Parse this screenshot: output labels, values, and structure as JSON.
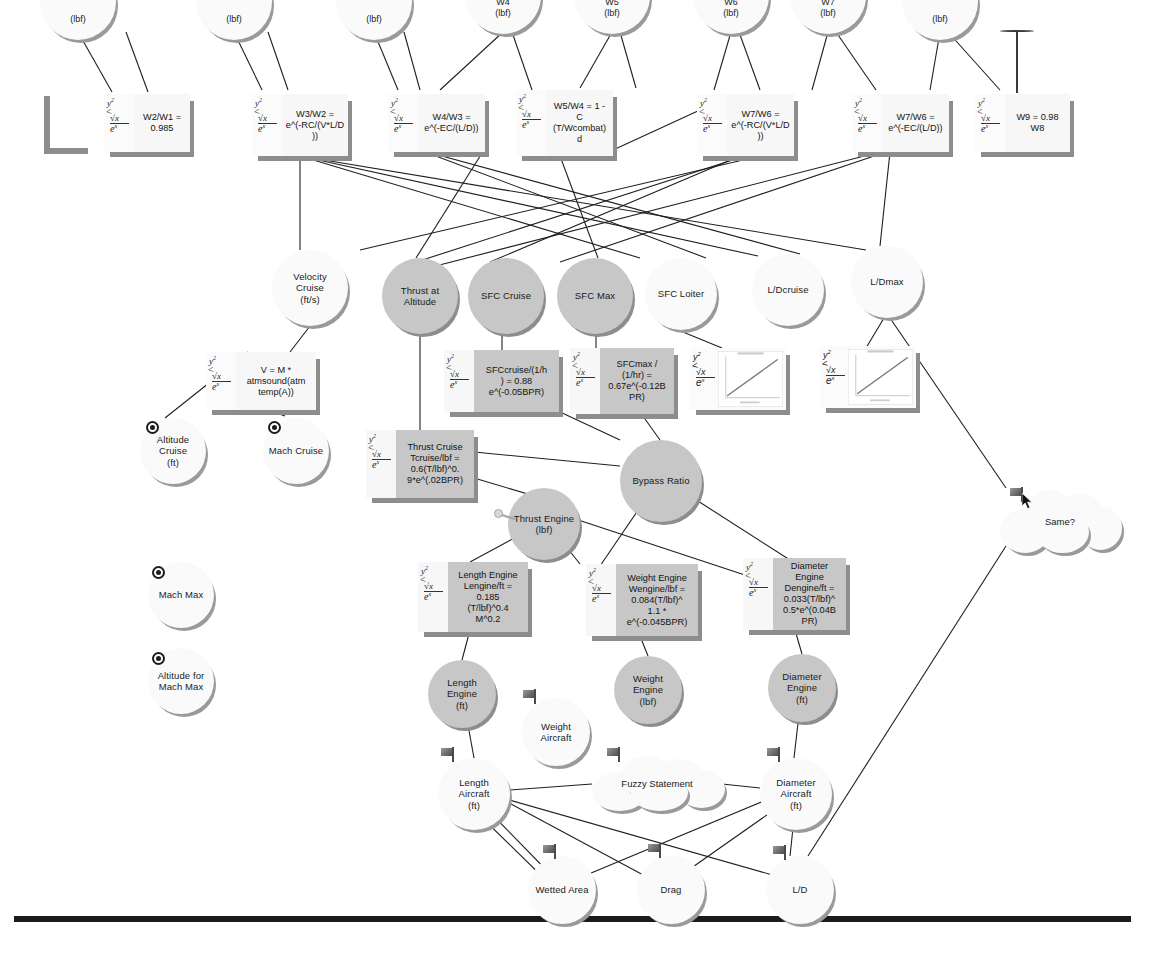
{
  "diagram": {
    "type": "node-link-diagram",
    "background": "#ffffff",
    "colors": {
      "node_white_fill": "#fafafa",
      "node_gray_fill": "#c7c7c7",
      "node_shadow": "#9a9a9a",
      "box_white_fill": "#f7f7f7",
      "box_gray_fill": "#c7c7c7",
      "edge_stroke": "#1f1f1f",
      "rule": "#1b1b1b"
    }
  },
  "top_nodes": [
    {
      "id": "w1",
      "label": "(lbf)",
      "x": 40,
      "y": -36,
      "d": 76
    },
    {
      "id": "w2",
      "label": "(lbf)",
      "x": 196,
      "y": -36,
      "d": 76
    },
    {
      "id": "w3",
      "label": "(lbf)",
      "x": 336,
      "y": -36,
      "d": 76
    },
    {
      "id": "w4",
      "label": "W4\n(lbf)",
      "x": 465,
      "y": -42,
      "d": 76
    },
    {
      "id": "w5",
      "label": "W5\n(lbf)",
      "x": 574,
      "y": -42,
      "d": 76
    },
    {
      "id": "w6",
      "label": "W6\n(lbf)",
      "x": 693,
      "y": -42,
      "d": 76
    },
    {
      "id": "w7",
      "label": "W7\n(lbf)",
      "x": 790,
      "y": -42,
      "d": 76
    },
    {
      "id": "w8",
      "label": "(lbf)",
      "x": 902,
      "y": -36,
      "d": 76
    }
  ],
  "formula_boxes": [
    {
      "id": "f_w2w1",
      "text": "W2/W1 =\n0.985",
      "x": 104,
      "y": 94,
      "w": 86,
      "h": 58,
      "style": "whitebox"
    },
    {
      "id": "f_w3w2",
      "text": "W3/W2  =\ne^(-RC/(V*L/D\n))",
      "x": 252,
      "y": 94,
      "w": 96,
      "h": 62,
      "style": "whitebox"
    },
    {
      "id": "f_w4w3",
      "text": "W4/W3  =\ne^(-EC/(L/D))",
      "x": 388,
      "y": 94,
      "w": 97,
      "h": 58,
      "style": "whitebox"
    },
    {
      "id": "f_w5w4",
      "text": "W5/W4 = 1 -\nC\n(T/Wcombat)\nd",
      "x": 516,
      "y": 90,
      "w": 97,
      "h": 66,
      "style": "whitebox"
    },
    {
      "id": "f_w7w6a",
      "text": "W7/W6  =\ne^(-RC/(V*L/D\n))",
      "x": 697,
      "y": 94,
      "w": 97,
      "h": 62,
      "style": "whitebox"
    },
    {
      "id": "f_w7w6b",
      "text": "W7/W6  =\ne^(-EC/(L/D))",
      "x": 852,
      "y": 94,
      "w": 97,
      "h": 58,
      "style": "whitebox"
    },
    {
      "id": "f_w9",
      "text": "W9 = 0.98\nW8",
      "x": 975,
      "y": 94,
      "w": 95,
      "h": 58,
      "style": "whitebox"
    },
    {
      "id": "f_v",
      "text": "V = M *\natmsound(atm\ntemp(A))",
      "x": 206,
      "y": 352,
      "w": 110,
      "h": 58,
      "style": "whitebox"
    },
    {
      "id": "f_sfcc",
      "text": "SFCcruise/(1/h\n) = 0.88\ne^(-0.05BPR)",
      "x": 444,
      "y": 350,
      "w": 115,
      "h": 62,
      "style": "graybox"
    },
    {
      "id": "f_sfcm",
      "text": "SFCmax /\n(1/hr) =\n0.67e^(-0.12B\nPR)",
      "x": 570,
      "y": 348,
      "w": 104,
      "h": 66,
      "style": "graybox"
    },
    {
      "id": "f_tcr",
      "text": "Thrust Cruise\nTcruise/lbf =\n0.6(T/lbf)^0.\n9*e^(.02BPR)",
      "x": 366,
      "y": 430,
      "w": 108,
      "h": 68,
      "style": "graybox"
    },
    {
      "id": "f_leng",
      "text": "Length Engine\nLengine/ft  =\n0.185\n(T/lbf)^0.4\nM^0.2",
      "x": 418,
      "y": 562,
      "w": 110,
      "h": 70,
      "style": "graybox"
    },
    {
      "id": "f_weng",
      "text": "Weight Engine\nWengine/lbf =\n0.084(T/lbf)^\n1.1 *\ne^(-0.045BPR)",
      "x": 586,
      "y": 564,
      "w": 112,
      "h": 72,
      "style": "graybox"
    },
    {
      "id": "f_deng",
      "text": "Diameter\nEngine\nDengine/ft  =\n0.033(T/lbf)^\n0.5*e^(0.04B\nPR)",
      "x": 743,
      "y": 558,
      "w": 103,
      "h": 72,
      "style": "graybox"
    }
  ],
  "chart_boxes": [
    {
      "id": "chart_ldcruise",
      "x": 690,
      "y": 348,
      "w": 96,
      "h": 62
    },
    {
      "id": "chart_ldmax",
      "x": 820,
      "y": 346,
      "w": 96,
      "h": 62
    }
  ],
  "mid_nodes": [
    {
      "id": "velocity_cruise",
      "label": "Velocity\nCruise\n(ft/s)",
      "x": 272,
      "y": 250,
      "d": 76,
      "fill": "white"
    },
    {
      "id": "thrust_altitude",
      "label": "Thrust at\nAltitude",
      "x": 382,
      "y": 258,
      "d": 76,
      "fill": "gray"
    },
    {
      "id": "sfc_cruise",
      "label": "SFC Cruise",
      "x": 468,
      "y": 258,
      "d": 76,
      "fill": "gray"
    },
    {
      "id": "sfc_max",
      "label": "SFC Max",
      "x": 557,
      "y": 258,
      "d": 76,
      "fill": "gray"
    },
    {
      "id": "sfc_loiter",
      "label": "SFC Loiter",
      "x": 645,
      "y": 258,
      "d": 72,
      "fill": "white"
    },
    {
      "id": "ld_cruise",
      "label": "L/Dcruise",
      "x": 752,
      "y": 254,
      "d": 72,
      "fill": "white"
    },
    {
      "id": "ld_max",
      "label": "L/Dmax",
      "x": 851,
      "y": 246,
      "d": 72,
      "fill": "white"
    },
    {
      "id": "bypass_ratio",
      "label": "Bypass Ratio",
      "x": 620,
      "y": 440,
      "d": 82,
      "fill": "gray"
    },
    {
      "id": "thrust_engine",
      "label": "Thrust Engine\n(lbf)",
      "x": 508,
      "y": 488,
      "d": 72,
      "fill": "gray"
    },
    {
      "id": "altitude_cruise",
      "label": "Altitude Cruise\n(ft)",
      "x": 140,
      "y": 418,
      "d": 66,
      "fill": "white"
    },
    {
      "id": "mach_cruise",
      "label": "Mach Cruise",
      "x": 263,
      "y": 418,
      "d": 66,
      "fill": "white"
    },
    {
      "id": "mach_max",
      "label": "Mach Max",
      "x": 148,
      "y": 562,
      "d": 66,
      "fill": "white"
    },
    {
      "id": "altitude_mach_max",
      "label": "Altitude for\nMach Max",
      "x": 148,
      "y": 648,
      "d": 66,
      "fill": "white"
    },
    {
      "id": "length_engine",
      "label": "Length Engine\n(ft)",
      "x": 428,
      "y": 660,
      "d": 68,
      "fill": "gray"
    },
    {
      "id": "weight_engine",
      "label": "Weight\nEngine\n(lbf)",
      "x": 614,
      "y": 656,
      "d": 68,
      "fill": "gray"
    },
    {
      "id": "diameter_engine",
      "label": "Diameter\nEngine\n(ft)",
      "x": 768,
      "y": 654,
      "d": 68,
      "fill": "gray"
    },
    {
      "id": "weight_aircraft",
      "label": "Weight\nAircraft",
      "x": 522,
      "y": 698,
      "d": 68,
      "fill": "white"
    },
    {
      "id": "length_aircraft",
      "label": "Length\nAircraft\n(ft)",
      "x": 438,
      "y": 758,
      "d": 72,
      "fill": "white"
    },
    {
      "id": "diameter_aircraft",
      "label": "Diameter\nAircraft\n(ft)",
      "x": 760,
      "y": 758,
      "d": 72,
      "fill": "white"
    },
    {
      "id": "wetted_area",
      "label": "Wetted Area",
      "x": 528,
      "y": 856,
      "d": 68,
      "fill": "white"
    },
    {
      "id": "drag",
      "label": "Drag",
      "x": 637,
      "y": 856,
      "d": 68,
      "fill": "white"
    },
    {
      "id": "ld",
      "label": "L/D",
      "x": 766,
      "y": 856,
      "d": 68,
      "fill": "white"
    }
  ],
  "clouds": [
    {
      "id": "fuzzy_statement",
      "label": "Fuzzy Statement",
      "x": 592,
      "y": 756,
      "w": 130,
      "h": 54
    },
    {
      "id": "same_question",
      "label": "Same?",
      "x": 1000,
      "y": 490,
      "w": 120,
      "h": 62
    }
  ],
  "option_icons": [
    {
      "id": "opt_altitude_cruise",
      "x": 146,
      "y": 421
    },
    {
      "id": "opt_mach_cruise",
      "x": 268,
      "y": 421
    },
    {
      "id": "opt_mach_max",
      "x": 152,
      "y": 566
    },
    {
      "id": "opt_altitude_mach_max",
      "x": 152,
      "y": 652
    }
  ],
  "flags": [
    {
      "id": "flag_weight_aircraft",
      "x": 523,
      "y": 689
    },
    {
      "id": "flag_length_aircraft",
      "x": 441,
      "y": 747
    },
    {
      "id": "flag_fuzzy_left",
      "x": 607,
      "y": 747
    },
    {
      "id": "flag_diameter_aircraft",
      "x": 767,
      "y": 747
    },
    {
      "id": "flag_wetted_area",
      "x": 543,
      "y": 844
    },
    {
      "id": "flag_drag",
      "x": 648,
      "y": 843
    },
    {
      "id": "flag_ld",
      "x": 773,
      "y": 845
    },
    {
      "id": "flag_same",
      "x": 1010,
      "y": 487
    }
  ],
  "edges": [
    [
      78,
      32,
      112,
      92
    ],
    [
      126,
      32,
      148,
      92
    ],
    [
      234,
      32,
      262,
      90
    ],
    [
      268,
      32,
      288,
      90
    ],
    [
      374,
      32,
      398,
      90
    ],
    [
      404,
      32,
      420,
      90
    ],
    [
      503,
      32,
      440,
      90
    ],
    [
      512,
      32,
      532,
      90
    ],
    [
      612,
      32,
      580,
      88
    ],
    [
      620,
      32,
      636,
      88
    ],
    [
      731,
      32,
      714,
      90
    ],
    [
      739,
      32,
      760,
      90
    ],
    [
      828,
      32,
      812,
      90
    ],
    [
      836,
      32,
      876,
      90
    ],
    [
      940,
      32,
      930,
      90
    ],
    [
      948,
      32,
      1000,
      90
    ],
    [
      300,
      156,
      300,
      250
    ],
    [
      300,
      156,
      640,
      258
    ],
    [
      300,
      156,
      758,
      256
    ],
    [
      300,
      156,
      866,
      250
    ],
    [
      420,
      150,
      706,
      258
    ],
    [
      420,
      150,
      800,
      254
    ],
    [
      484,
      150,
      416,
      258
    ],
    [
      560,
      156,
      598,
      258
    ],
    [
      600,
      156,
      700,
      110
    ],
    [
      740,
      156,
      490,
      262
    ],
    [
      745,
      156,
      410,
      264
    ],
    [
      760,
      156,
      360,
      250
    ],
    [
      880,
      152,
      420,
      270
    ],
    [
      886,
      152,
      560,
      262
    ],
    [
      890,
      152,
      880,
      246
    ],
    [
      310,
      326,
      290,
      352
    ],
    [
      248,
      352,
      165,
      418
    ],
    [
      268,
      410,
      285,
      416
    ],
    [
      420,
      334,
      420,
      430
    ],
    [
      502,
      334,
      502,
      350
    ],
    [
      596,
      334,
      596,
      348
    ],
    [
      678,
      330,
      722,
      348
    ],
    [
      884,
      318,
      866,
      348
    ],
    [
      474,
      452,
      620,
      466
    ],
    [
      474,
      478,
      548,
      500
    ],
    [
      560,
      412,
      620,
      440
    ],
    [
      640,
      412,
      660,
      440
    ],
    [
      545,
      520,
      580,
      564
    ],
    [
      540,
      524,
      470,
      562
    ],
    [
      660,
      478,
      600,
      566
    ],
    [
      662,
      478,
      790,
      560
    ],
    [
      548,
      510,
      760,
      580
    ],
    [
      470,
      630,
      462,
      660
    ],
    [
      640,
      636,
      648,
      656
    ],
    [
      795,
      630,
      802,
      654
    ],
    [
      462,
      692,
      474,
      758
    ],
    [
      648,
      690,
      648,
      700
    ],
    [
      802,
      688,
      794,
      758
    ],
    [
      510,
      790,
      592,
      784
    ],
    [
      722,
      784,
      760,
      788
    ],
    [
      474,
      784,
      660,
      884
    ],
    [
      474,
      790,
      790,
      880
    ],
    [
      476,
      798,
      560,
      884
    ],
    [
      468,
      804,
      556,
      890
    ],
    [
      790,
      790,
      560,
      886
    ],
    [
      794,
      796,
      660,
      890
    ],
    [
      796,
      800,
      790,
      856
    ],
    [
      1006,
      546,
      808,
      856
    ],
    [
      1006,
      488,
      890,
      318
    ]
  ],
  "bottom_rule": {
    "x": 14,
    "y": 916,
    "w": 1117,
    "h": 6
  },
  "math_glyph": {
    "numerator": "y",
    "exponent": "2",
    "rel": "<",
    "radical": "√x",
    "denominator": "e",
    "denom_exp": "x"
  }
}
